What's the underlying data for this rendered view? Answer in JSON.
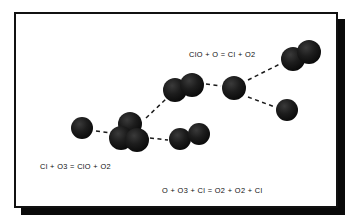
{
  "diagram": {
    "frame": {
      "border_color": "#111111",
      "shadow_color": "#0a0a0a",
      "background": "#ffffff"
    },
    "atom_color": "#151515",
    "bond_line_color": "#1a1a1a",
    "labels": {
      "reaction_top": "ClO + O = Cl + O2",
      "reaction_bottom_left": "Cl + O3 = ClO + O2",
      "reaction_net": "O + O3 + Cl =  O2 + O2 + Cl"
    },
    "molecules": [
      {
        "name": "chlorine-atom-left",
        "formula": "Cl",
        "atoms": 1,
        "spheres": [
          {
            "cx": 66,
            "cy": 114,
            "r": 11
          }
        ]
      },
      {
        "name": "ozone-molecule",
        "formula": "O3",
        "atoms": 3,
        "spheres": [
          {
            "cx": 114,
            "cy": 110,
            "r": 12
          },
          {
            "cx": 105,
            "cy": 124,
            "r": 12
          },
          {
            "cx": 121,
            "cy": 126,
            "r": 12
          }
        ]
      },
      {
        "name": "oxygen-molecule-lower",
        "formula": "O2",
        "atoms": 2,
        "spheres": [
          {
            "cx": 164,
            "cy": 125,
            "r": 11
          },
          {
            "cx": 183,
            "cy": 120,
            "r": 11
          }
        ]
      },
      {
        "name": "chlorine-monoxide-molecule",
        "formula": "ClO",
        "atoms": 2,
        "spheres": [
          {
            "cx": 159,
            "cy": 76,
            "r": 12
          },
          {
            "cx": 176,
            "cy": 71,
            "r": 12
          }
        ]
      },
      {
        "name": "oxygen-atom-middle",
        "formula": "O",
        "atoms": 1,
        "spheres": [
          {
            "cx": 218,
            "cy": 74,
            "r": 12
          }
        ]
      },
      {
        "name": "oxygen-molecule-upper-right",
        "formula": "O2",
        "atoms": 2,
        "spheres": [
          {
            "cx": 277,
            "cy": 45,
            "r": 12
          },
          {
            "cx": 293,
            "cy": 38,
            "r": 12
          }
        ]
      },
      {
        "name": "chlorine-atom-right",
        "formula": "Cl",
        "atoms": 1,
        "spheres": [
          {
            "cx": 271,
            "cy": 96,
            "r": 11
          }
        ]
      }
    ],
    "connectors": [
      {
        "name": "cl-to-ozone",
        "x1": 80,
        "y1": 117,
        "x2": 96,
        "y2": 119
      },
      {
        "name": "ozone-to-oxygen-lower",
        "x1": 134,
        "y1": 124,
        "x2": 152,
        "y2": 126
      },
      {
        "name": "ozone-to-clo",
        "x1": 130,
        "y1": 104,
        "x2": 150,
        "y2": 85
      },
      {
        "name": "clo-to-oxygen-atom",
        "x1": 190,
        "y1": 70,
        "x2": 205,
        "y2": 72
      },
      {
        "name": "oxygen-atom-to-o2",
        "x1": 232,
        "y1": 66,
        "x2": 264,
        "y2": 50
      },
      {
        "name": "oxygen-atom-to-cl",
        "x1": 232,
        "y1": 83,
        "x2": 259,
        "y2": 93
      }
    ]
  }
}
